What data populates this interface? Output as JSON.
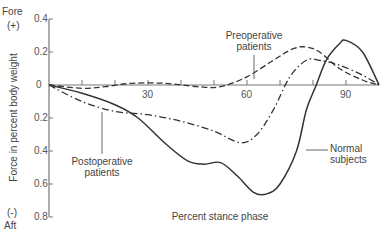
{
  "chart_data": {
    "type": "line",
    "title": "",
    "xlabel": "Percent stance phase",
    "ylabel": "Force in percent body weight",
    "y_top_label": [
      "Fore",
      "(+)"
    ],
    "y_bottom_label": [
      "(-)",
      "Aft"
    ],
    "xlim": [
      0,
      100
    ],
    "ylim": [
      -0.8,
      0.4
    ],
    "x_ticks": [
      10,
      20,
      30,
      40,
      50,
      60,
      70,
      80,
      90
    ],
    "x_tick_labels": [
      "30",
      "60",
      "90"
    ],
    "y_tick_labels": [
      "0.4",
      "0.2",
      "0",
      "0.2",
      "0.4",
      "0.6",
      "0.8"
    ],
    "grid": false,
    "series": [
      {
        "name": "Normal subjects",
        "style": "solid",
        "x": [
          0,
          10,
          20,
          27,
          35,
          42,
          47,
          52,
          57,
          62,
          66,
          70,
          75,
          78,
          81,
          84,
          88,
          90,
          95,
          100
        ],
        "values": [
          0,
          -0.05,
          -0.12,
          -0.2,
          -0.35,
          -0.46,
          -0.48,
          -0.47,
          -0.55,
          -0.65,
          -0.66,
          -0.6,
          -0.4,
          -0.15,
          0,
          0.15,
          0.25,
          0.27,
          0.2,
          0
        ]
      },
      {
        "name": "Preoperative patients",
        "style": "dashed",
        "x": [
          0,
          10,
          17,
          25,
          35,
          45,
          52,
          60,
          68,
          74,
          78,
          82,
          88,
          95,
          100
        ],
        "values": [
          0,
          -0.02,
          -0.01,
          0.01,
          0.01,
          -0.01,
          -0.01,
          0.05,
          0.15,
          0.22,
          0.23,
          0.2,
          0.1,
          0.03,
          0
        ]
      },
      {
        "name": "Postoperative patients",
        "style": "dash-dot",
        "x": [
          0,
          10,
          20,
          30,
          40,
          50,
          58,
          63,
          68,
          73,
          78,
          82,
          88,
          95,
          100
        ],
        "values": [
          0,
          -0.1,
          -0.16,
          -0.18,
          -0.22,
          -0.28,
          -0.35,
          -0.3,
          -0.15,
          0.05,
          0.15,
          0.15,
          0.12,
          0.06,
          0
        ]
      }
    ],
    "annotations": [
      {
        "text": [
          "Preoperative",
          "patients"
        ],
        "series": "Preoperative patients"
      },
      {
        "text": [
          "Postoperative",
          "patients"
        ],
        "series": "Postoperative patients"
      },
      {
        "text": [
          "Normal",
          "subjects"
        ],
        "series": "Normal subjects"
      }
    ],
    "colors": {
      "axis": "#777777",
      "line": "#333333"
    }
  },
  "labels": {
    "fore": "Fore",
    "plus": "(+)",
    "minus": "(-)",
    "aft": "Aft",
    "ylabel": "Force in percent body weight",
    "xlabel": "Percent stance phase",
    "pre1": "Preoperative",
    "pre2": "patients",
    "post1": "Postoperative",
    "post2": "patients",
    "norm1": "Normal",
    "norm2": "subjects",
    "y": [
      "0.4",
      "0.2",
      "0",
      "0.2",
      "0.4",
      "0.6",
      "0.8"
    ],
    "x": [
      "30",
      "60",
      "90"
    ]
  }
}
